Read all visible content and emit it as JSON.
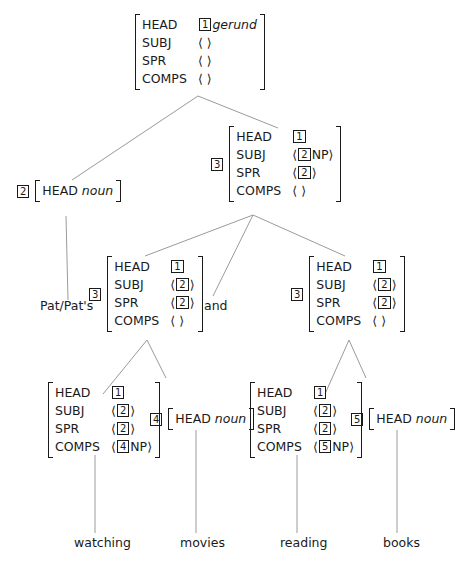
{
  "tree": {
    "root": {
      "features": [
        {
          "feat": "HEAD",
          "tag": "1",
          "value": "gerund",
          "value_italic": true
        },
        {
          "feat": "SUBJ",
          "list": "⟨ ⟩"
        },
        {
          "feat": "SPR",
          "list": "⟨ ⟩"
        },
        {
          "feat": "COMPS",
          "list": "⟨ ⟩"
        }
      ]
    },
    "specifier": {
      "tag": "2",
      "feat": "HEAD",
      "value": "noun",
      "word": "Pat/Pat's"
    },
    "coord_phrase": {
      "tag": "3",
      "features": [
        {
          "feat": "HEAD",
          "tag": "1"
        },
        {
          "feat": "SUBJ",
          "open": "⟨",
          "tag": "2",
          "extra": "NP",
          "close": "⟩"
        },
        {
          "feat": "SPR",
          "open": "⟨",
          "tag": "2",
          "close": "⟩"
        },
        {
          "feat": "COMPS",
          "list": "⟨ ⟩"
        }
      ]
    },
    "conj_left": {
      "tag": "3",
      "features": [
        {
          "feat": "HEAD",
          "tag": "1"
        },
        {
          "feat": "SUBJ",
          "open": "⟨",
          "tag": "2",
          "close": "⟩"
        },
        {
          "feat": "SPR",
          "open": "⟨",
          "tag": "2",
          "close": "⟩"
        },
        {
          "feat": "COMPS",
          "list": "⟨ ⟩"
        }
      ]
    },
    "conjunction": "and",
    "conj_right": {
      "tag": "3",
      "features": [
        {
          "feat": "HEAD",
          "tag": "1"
        },
        {
          "feat": "SUBJ",
          "open": "⟨",
          "tag": "2",
          "close": "⟩"
        },
        {
          "feat": "SPR",
          "open": "⟨",
          "tag": "2",
          "close": "⟩"
        },
        {
          "feat": "COMPS",
          "list": "⟨ ⟩"
        }
      ]
    },
    "verb_left": {
      "features": [
        {
          "feat": "HEAD",
          "tag": "1"
        },
        {
          "feat": "SUBJ",
          "open": "⟨",
          "tag": "2",
          "close": "⟩"
        },
        {
          "feat": "SPR",
          "open": "⟨",
          "tag": "2",
          "close": "⟩"
        },
        {
          "feat": "COMPS",
          "open": "⟨",
          "tag": "4",
          "extra": "NP",
          "close": "⟩"
        }
      ],
      "word": "watching"
    },
    "noun_left": {
      "tag": "4",
      "feat": "HEAD",
      "value": "noun",
      "word": "movies"
    },
    "verb_right": {
      "features": [
        {
          "feat": "HEAD",
          "tag": "1"
        },
        {
          "feat": "SUBJ",
          "open": "⟨",
          "tag": "2",
          "close": "⟩"
        },
        {
          "feat": "SPR",
          "open": "⟨",
          "tag": "2",
          "close": "⟩"
        },
        {
          "feat": "COMPS",
          "open": "⟨",
          "tag": "5",
          "extra": "NP",
          "close": "⟩"
        }
      ],
      "word": "reading"
    },
    "noun_right": {
      "tag": "5",
      "feat": "HEAD",
      "value": "noun",
      "word": "books"
    }
  }
}
